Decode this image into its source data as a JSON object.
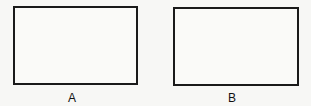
{
  "figure": {
    "panels": [
      {
        "id": "A",
        "label": "A",
        "shape": "rectangle",
        "border_color": "#1a1a1a"
      },
      {
        "id": "B",
        "label": "B",
        "shape": "rectangle",
        "border_color": "#1a1a1a"
      }
    ],
    "background_color": "#f7f7f5"
  }
}
